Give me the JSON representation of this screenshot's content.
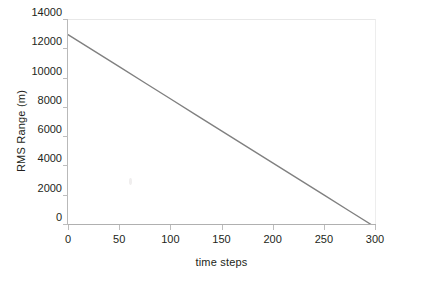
{
  "figure": {
    "background_color": "#ffffff",
    "width": 432,
    "height": 289
  },
  "chart_data": {
    "type": "line",
    "title": "",
    "subtitle": "",
    "xlabel": "time steps",
    "ylabel": "RMS Range (m)",
    "xlim": [
      0,
      300
    ],
    "ylim": [
      0,
      14000
    ],
    "xticks": [
      0,
      50,
      100,
      150,
      200,
      250,
      300
    ],
    "xtick_labels": [
      "0",
      "50",
      "100",
      "150",
      "200",
      "250",
      "300"
    ],
    "yticks": [
      0,
      2000,
      4000,
      6000,
      8000,
      10000,
      12000,
      14000
    ],
    "ytick_labels": [
      "0",
      "2000",
      "4000",
      "6000",
      "8000",
      "10000",
      "12000",
      "14000"
    ],
    "grid": false,
    "legend": null,
    "legend_position": "none",
    "series": [
      {
        "name": "RMS Range",
        "color": "#808080",
        "line_width": 1.4,
        "marker": "none",
        "x": [
          0,
          25,
          50,
          75,
          100,
          125,
          150,
          175,
          200,
          225,
          250,
          275,
          297
        ],
        "values": [
          13000,
          11905,
          10811,
          9716,
          8621,
          7526,
          6431,
          5337,
          4242,
          3147,
          2052,
          957,
          0
        ]
      }
    ],
    "annotations": []
  },
  "axes_style": {
    "axis_line_color": "#b0b0b0",
    "tick_color": "#bdbdbd",
    "top_border_color": "#e8e8e8",
    "right_border_color": "#ededed",
    "text_color": "#231f20"
  }
}
